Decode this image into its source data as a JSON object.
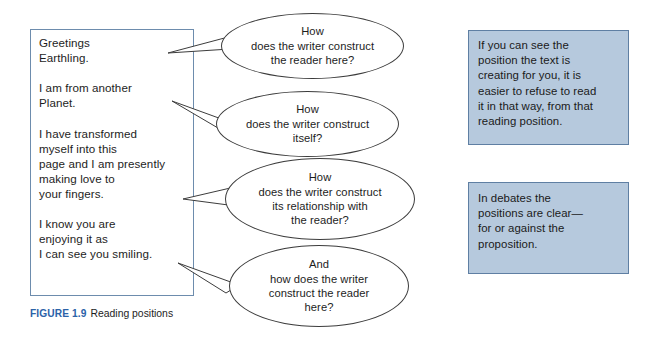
{
  "figure": {
    "caption_label": "FIGURE 1.9",
    "caption_title": "Reading positions",
    "caption_label_color": "#2b62a8"
  },
  "letter": {
    "name": "alien-letter",
    "text": "Greetings\nEarthling.\n\nI am from another\nPlanet.\n\nI have transformed\nmyself into this\npage and I am presently\nmaking love to\nyour fingers.\n\nI know you are\nenjoying it as\nI can see you smiling.",
    "border_color": "#6d8cad",
    "background_color": "#ffffff"
  },
  "bubbles": [
    {
      "id": "bubble-1",
      "text": "How\ndoes the writer construct\nthe reader here?"
    },
    {
      "id": "bubble-2",
      "text": "How\ndoes the writer construct\nitself?"
    },
    {
      "id": "bubble-3",
      "text": "How\ndoes the writer construct\nits relationship with\nthe reader?"
    },
    {
      "id": "bubble-4",
      "text": "And\nhow does the writer\nconstruct the reader\nhere?"
    }
  ],
  "notes": [
    {
      "id": "note-box-1",
      "text": "If you can see the\nposition the text is\ncreating for you, it is\neasier to refuse to read\nit in that way, from that\nreading position.",
      "background_color": "#b6c9dd",
      "border_color": "#5f7fa3"
    },
    {
      "id": "note-box-2",
      "text": "In debates the\npositions are clear—\nfor or against the\nproposition.",
      "background_color": "#b6c9dd",
      "border_color": "#5f7fa3"
    }
  ]
}
